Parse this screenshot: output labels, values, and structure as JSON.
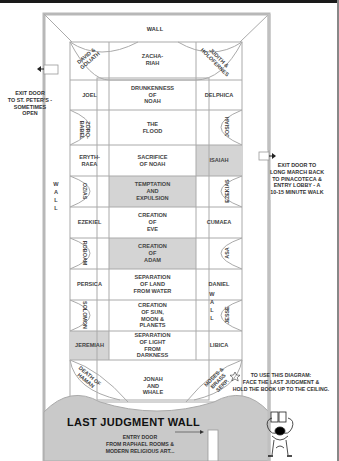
{
  "top_wall": "WALL",
  "left_wall": "W\nA\nL\nL",
  "right_wall": "W\nA\nL\nL",
  "exit_left": "EXIT DOOR\nTO ST. PETER'S -\nSOMETIMES\nOPEN",
  "exit_right": "EXIT DOOR TO\nLONG MARCH BACK\nTO PINACOTECA &\nENTRY LOBBY - A\n10-15 MINUTE WALK",
  "last_judgment": "LAST JUDGMENT WALL",
  "entry_door": "ENTRY DOOR\nFROM RAPHAEL ROOMS &\nMODERN RELIGIOUS ART...",
  "instructions": "TO USE THIS DIAGRAM:\nFACE THE LAST JUDGMENT &\nHOLD THE BOOK UP TO THE CEILING.",
  "corners": {
    "top_left": "DAVID &\nGOLIATH",
    "top_right": "JUDITH &\nHOLOFERNES",
    "bottom_left": "DEATH OF\nHAMAN",
    "bottom_right": "MOSES &\nBRASS\nSERP."
  },
  "center_panels": [
    "ZACHA-\nRIAH",
    "DRUNKENNESS\nOF\nNOAH",
    "THE\nFLOOD",
    "SACRIFICE\nOF NOAH",
    "TEMPTATION\nAND\nEXPULSION",
    "CREATION\nOF\nEVE",
    "CREATION\nOF\nADAM",
    "SEPARATION\nOF LAND\nFROM WATER",
    "CREATION\nOF SUN,\nMOON &\nPLANETS",
    "SEPARATION\nOF LIGHT\nFROM\nDARKNESS",
    "JONAH\nAND\nWHALE"
  ],
  "left_column": [
    {
      "label": "JOEL",
      "type": "seer"
    },
    {
      "label": "ZORO-\nBABEL",
      "type": "lunette"
    },
    {
      "label": "ERYTH-\nRAEA",
      "type": "seer"
    },
    {
      "label": "OZIAS",
      "type": "lunette"
    },
    {
      "label": "EZEKIEL",
      "type": "seer"
    },
    {
      "label": "ROBOAM",
      "type": "lunette"
    },
    {
      "label": "PERSICA",
      "type": "seer"
    },
    {
      "label": "SOLOMON",
      "type": "lunette"
    },
    {
      "label": "JEREMIAH",
      "type": "seer",
      "highlight": true
    }
  ],
  "right_column": [
    {
      "label": "DELPHICA",
      "type": "seer"
    },
    {
      "label": "JOSIAH",
      "type": "lunette"
    },
    {
      "label": "ISAIAH",
      "type": "seer",
      "highlight": true
    },
    {
      "label": "EZEKIAS",
      "type": "lunette"
    },
    {
      "label": "CUMAEA",
      "type": "seer"
    },
    {
      "label": "ASA",
      "type": "lunette"
    },
    {
      "label": "DANIEL",
      "type": "seer"
    },
    {
      "label": "JESSE",
      "type": "lunette"
    },
    {
      "label": "LIBICA",
      "type": "seer"
    }
  ],
  "colors": {
    "line": "#aaaaaa",
    "highlight": "#d4d4d4",
    "wall": "#c9c9c9"
  }
}
